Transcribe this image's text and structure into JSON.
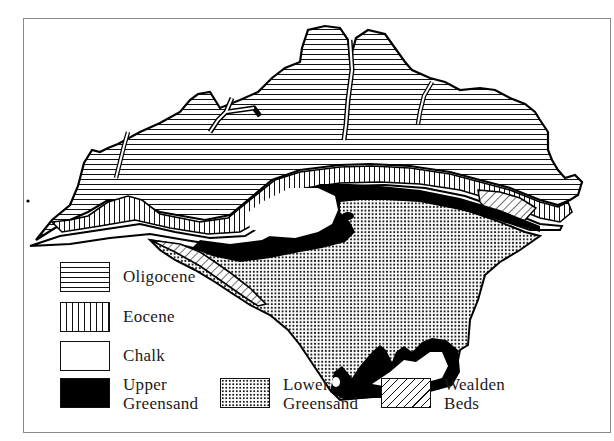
{
  "figure": {
    "frame_color": "#8a8a8a"
  },
  "legend": {
    "items": [
      {
        "id": "oligocene",
        "label": "Oligocene",
        "pattern": "horizontal-lines"
      },
      {
        "id": "eocene",
        "label": "Eocene",
        "pattern": "vertical-lines"
      },
      {
        "id": "chalk",
        "label": "Chalk",
        "pattern": "blank"
      },
      {
        "id": "upper_greensand",
        "label_line1": "Upper",
        "label_line2": "Greensand",
        "pattern": "solid-black"
      },
      {
        "id": "lower_greensand",
        "label_line1": "Lower",
        "label_line2": "Greensand",
        "pattern": "dots"
      },
      {
        "id": "wealden_beds",
        "label_line1": "Wealden",
        "label_line2": "Beds",
        "pattern": "diagonal-lines"
      }
    ]
  },
  "map": {
    "regions": [
      "Oligocene",
      "Eocene",
      "Chalk",
      "Upper Greensand",
      "Lower Greensand",
      "Wealden Beds"
    ]
  }
}
